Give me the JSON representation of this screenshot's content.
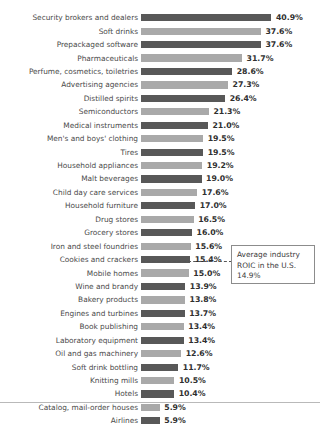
{
  "chart_data": {
    "type": "bar",
    "title": "",
    "subtitle": "",
    "xlabel": "",
    "ylabel": "",
    "orientation": "horizontal",
    "grid": false,
    "legend": "none",
    "value_suffix": "%",
    "xlim": [
      0,
      40.9
    ],
    "categories": [
      "Security brokers and dealers",
      "Soft drinks",
      "Prepackaged software",
      "Pharmaceuticals",
      "Perfume, cosmetics, toiletries",
      "Advertising agencies",
      "Distilled spirits",
      "Semiconductors",
      "Medical instruments",
      "Men's and boys' clothing",
      "Tires",
      "Household appliances",
      "Malt beverages",
      "Child day care services",
      "Household furniture",
      "Drug stores",
      "Grocery stores",
      "Iron and steel foundries",
      "Cookies and crackers",
      "Mobile homes",
      "Wine and brandy",
      "Bakery products",
      "Engines and turbines",
      "Book publishing",
      "Laboratory equipment",
      "Oil and gas machinery",
      "Soft drink bottling",
      "Knitting mills",
      "Hotels",
      "Catalog, mail-order houses",
      "Airlines"
    ],
    "values": [
      40.9,
      37.6,
      37.6,
      31.7,
      28.6,
      27.3,
      26.4,
      21.3,
      21.0,
      19.5,
      19.5,
      19.2,
      19.0,
      17.6,
      17.0,
      16.5,
      16.0,
      15.6,
      15.4,
      15.0,
      13.9,
      13.8,
      13.7,
      13.4,
      13.4,
      12.6,
      11.7,
      10.5,
      10.4,
      5.9,
      5.9
    ],
    "value_labels": [
      "40.9%",
      "37.6%",
      "37.6%",
      "31.7%",
      "28.6%",
      "27.3%",
      "26.4%",
      "21.3%",
      "21.0%",
      "19.5%",
      "19.5%",
      "19.2%",
      "19.0%",
      "17.6%",
      "17.0%",
      "16.5%",
      "16.0%",
      "15.6%",
      "15.4%",
      "15.0%",
      "13.9%",
      "13.8%",
      "13.7%",
      "13.4%",
      "13.4%",
      "12.6%",
      "11.7%",
      "10.5%",
      "10.4%",
      "5.9%",
      "5.9%"
    ],
    "bar_styles": [
      "dark",
      "light",
      "dark",
      "light",
      "dark",
      "light",
      "dark",
      "light",
      "dark",
      "light",
      "dark",
      "light",
      "dark",
      "light",
      "dark",
      "light",
      "dark",
      "light",
      "dark",
      "light",
      "dark",
      "light",
      "dark",
      "light",
      "dark",
      "light",
      "dark",
      "light",
      "dark",
      "light",
      "dark"
    ],
    "colors": {
      "bar_dark": "#585858",
      "bar_light": "#a9a9a9",
      "label_text": "#4a4a4a",
      "value_text": "#2f2f2f",
      "reference_line": "#555555",
      "callout_border": "#8c8c8c",
      "background": "#ffffff"
    },
    "annotations": [
      {
        "name": "average-industry-roic",
        "line1": "Average industry",
        "line2": "ROIC in the U.S.",
        "line3": "14.9%",
        "value": 14.9,
        "line_style": "dashed"
      }
    ]
  }
}
